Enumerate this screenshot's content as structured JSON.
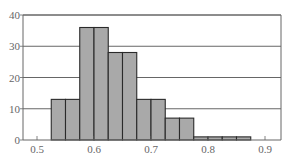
{
  "chart_data": {
    "type": "bar",
    "subtype": "histogram",
    "title": "",
    "xlabel": "",
    "ylabel": "",
    "bin_width": 0.025,
    "bins": [
      {
        "start": 0.525,
        "end": 0.55,
        "count": 13
      },
      {
        "start": 0.55,
        "end": 0.575,
        "count": 13
      },
      {
        "start": 0.575,
        "end": 0.6,
        "count": 36
      },
      {
        "start": 0.6,
        "end": 0.625,
        "count": 36
      },
      {
        "start": 0.625,
        "end": 0.65,
        "count": 28
      },
      {
        "start": 0.65,
        "end": 0.675,
        "count": 28
      },
      {
        "start": 0.675,
        "end": 0.7,
        "count": 13
      },
      {
        "start": 0.7,
        "end": 0.725,
        "count": 13
      },
      {
        "start": 0.725,
        "end": 0.75,
        "count": 7
      },
      {
        "start": 0.75,
        "end": 0.775,
        "count": 7
      },
      {
        "start": 0.775,
        "end": 0.8,
        "count": 1
      },
      {
        "start": 0.8,
        "end": 0.825,
        "count": 1
      },
      {
        "start": 0.825,
        "end": 0.85,
        "count": 1
      },
      {
        "start": 0.85,
        "end": 0.875,
        "count": 1
      }
    ],
    "x_ticks": [
      0.5,
      0.6,
      0.7,
      0.8,
      0.9
    ],
    "x_tick_labels": [
      "0.5",
      "0.6",
      "0.7",
      "0.8",
      "0.9"
    ],
    "y_ticks": [
      0,
      10,
      20,
      30,
      40
    ],
    "y_tick_labels": [
      "0",
      "10",
      "20",
      "30",
      "40"
    ],
    "xlim": [
      0.47,
      0.93
    ],
    "ylim": [
      0,
      40
    ],
    "grid": {
      "horizontal": true,
      "vertical": false
    },
    "legend": null,
    "colors": {
      "bar_fill": "#a9a9a9",
      "bar_edge": "#2a2a2a",
      "grid": "#555555",
      "axis": "#666666"
    }
  }
}
